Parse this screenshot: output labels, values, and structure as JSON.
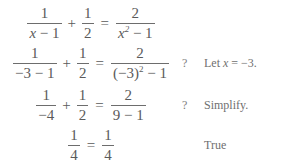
{
  "document": {
    "title": "Equation Check",
    "text_color": "#5a5a5a",
    "background_color": "#ffffff",
    "rule_color": "#6d6d6d"
  },
  "lines": [
    {
      "id": "line-1",
      "marker": "",
      "note": "",
      "left": {
        "frac1": {
          "num": "1",
          "den_prefix": "x",
          "den_op": "−",
          "den_suffix": "1"
        },
        "plus": "+",
        "frac2": {
          "num": "1",
          "den": "2"
        }
      },
      "equals": "=",
      "right": {
        "num": "2",
        "den_prefix": "x",
        "den_exp": "2",
        "den_op": "−",
        "den_suffix": "1"
      }
    },
    {
      "id": "line-2",
      "marker": "?",
      "note_prefix": "Let ",
      "note_var": "x",
      "note_suffix": " = −3.",
      "left": {
        "frac1": {
          "num": "1",
          "den_prefix": "−3",
          "den_op": "−",
          "den_suffix": "1"
        },
        "plus": "+",
        "frac2": {
          "num": "1",
          "den": "2"
        }
      },
      "equals": "=",
      "right": {
        "num": "2",
        "den_prefix": "(−3)",
        "den_exp": "2",
        "den_op": "−",
        "den_suffix": "1"
      }
    },
    {
      "id": "line-3",
      "marker": "?",
      "note": "Simplify.",
      "left": {
        "frac1": {
          "num": "1",
          "den": "−4"
        },
        "plus": "+",
        "frac2": {
          "num": "1",
          "den": "2"
        }
      },
      "equals": "=",
      "right": {
        "num": "2",
        "den_prefix": "9",
        "den_op": "−",
        "den_suffix": "1"
      }
    },
    {
      "id": "line-4",
      "marker": "",
      "note": "True",
      "left": {
        "frac1": {
          "num": "1",
          "den": "4"
        }
      },
      "equals": "=",
      "right": {
        "num": "1",
        "den": "4"
      }
    }
  ]
}
